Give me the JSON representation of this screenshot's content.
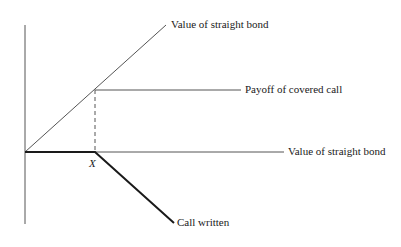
{
  "diagram": {
    "strike_label": "X",
    "labels": {
      "straight_bond_upper": "Value of straight bond",
      "covered_call": "Payoff of covered call",
      "straight_bond_lower": "Value of straight bond",
      "call_written": "Call written"
    },
    "colors": {
      "line": "#555555",
      "bold_line": "#1a1a1a",
      "background": "#ffffff"
    },
    "geometry": {
      "origin": [
        25,
        152
      ],
      "strike_point": [
        95,
        152
      ],
      "kink_point": [
        95,
        90
      ],
      "bond_line_end": [
        166,
        25
      ],
      "covered_call_end": [
        241,
        90
      ],
      "axis_end": [
        284,
        152
      ],
      "call_written_end": [
        174,
        223
      ]
    }
  }
}
